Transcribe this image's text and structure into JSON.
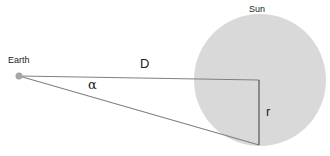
{
  "diagram": {
    "labels": {
      "earth": "Earth",
      "sun": "Sun",
      "distance": "D",
      "angle": "α",
      "radius": "r"
    },
    "colors": {
      "sun_fill": "#d9d9d9",
      "earth_fill": "#a6a6a6",
      "line": "#7f7f7f"
    }
  }
}
